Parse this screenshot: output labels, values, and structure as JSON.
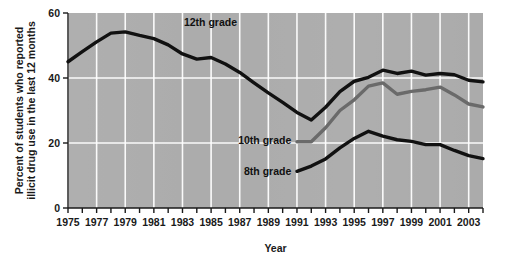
{
  "chart_data": {
    "type": "line",
    "title": "",
    "xlabel": "Year",
    "ylabel": "Percent of students who reported illicit drug use in the last 12 months",
    "xlim": [
      1975,
      2004
    ],
    "ylim": [
      0,
      60
    ],
    "yticks": [
      0,
      20,
      40,
      60
    ],
    "ytick_labels": [
      "0",
      "20",
      "40",
      "60"
    ],
    "xticks": [
      1975,
      1976,
      1977,
      1978,
      1979,
      1980,
      1981,
      1982,
      1983,
      1984,
      1985,
      1986,
      1987,
      1988,
      1989,
      1990,
      1991,
      1992,
      1993,
      1994,
      1995,
      1996,
      1997,
      1998,
      1999,
      2000,
      2001,
      2002,
      2003,
      2004
    ],
    "xtick_labels": [
      "1975",
      "",
      "1977",
      "",
      "1979",
      "",
      "1981",
      "",
      "1983",
      "",
      "1985",
      "",
      "1987",
      "",
      "1989",
      "",
      "1991",
      "",
      "1993",
      "",
      "1995",
      "",
      "1997",
      "",
      "1999",
      "",
      "2001",
      "",
      "2003",
      ""
    ],
    "grid": {
      "vertical": true,
      "horizontal": true,
      "vertical_at_labeled_ticks": true
    },
    "legend_position": "inline-annotations",
    "plot_background": "#adadad",
    "grid_color": "#ffffff",
    "series": [
      {
        "name": "12th grade",
        "color": "#111111",
        "label_x": 1983.1,
        "label_y": 57.2,
        "x": [
          1975,
          1976,
          1977,
          1978,
          1979,
          1980,
          1981,
          1982,
          1983,
          1984,
          1985,
          1986,
          1987,
          1988,
          1989,
          1990,
          1991,
          1992,
          1993,
          1994,
          1995,
          1996,
          1997,
          1998,
          1999,
          2000,
          2001,
          2002,
          2003,
          2004
        ],
        "values": [
          45.0,
          48.1,
          51.1,
          53.8,
          54.2,
          53.1,
          52.1,
          50.2,
          47.4,
          45.8,
          46.3,
          44.3,
          41.7,
          38.5,
          35.4,
          32.5,
          29.4,
          27.1,
          31.0,
          35.8,
          39.0,
          40.2,
          42.4,
          41.4,
          42.1,
          40.9,
          41.4,
          41.0,
          39.3,
          38.8
        ]
      },
      {
        "name": "10th grade",
        "color": "#6a6a6a",
        "label_x": 1990.6,
        "label_y": 21.0,
        "label_anchor": "end",
        "x": [
          1991,
          1992,
          1993,
          1994,
          1995,
          1996,
          1997,
          1998,
          1999,
          2000,
          2001,
          2002,
          2003,
          2004
        ],
        "values": [
          20.4,
          20.4,
          24.7,
          30.0,
          33.3,
          37.5,
          38.5,
          35.0,
          35.9,
          36.4,
          37.2,
          34.8,
          32.0,
          31.1
        ]
      },
      {
        "name": "8th grade",
        "color": "#111111",
        "label_x": 1990.6,
        "label_y": 11.5,
        "label_anchor": "end",
        "x": [
          1991,
          1992,
          1993,
          1994,
          1995,
          1996,
          1997,
          1998,
          1999,
          2000,
          2001,
          2002,
          2003,
          2004
        ],
        "values": [
          11.3,
          12.9,
          15.1,
          18.5,
          21.4,
          23.6,
          22.1,
          21.0,
          20.5,
          19.5,
          19.5,
          17.7,
          16.1,
          15.2
        ]
      }
    ]
  }
}
